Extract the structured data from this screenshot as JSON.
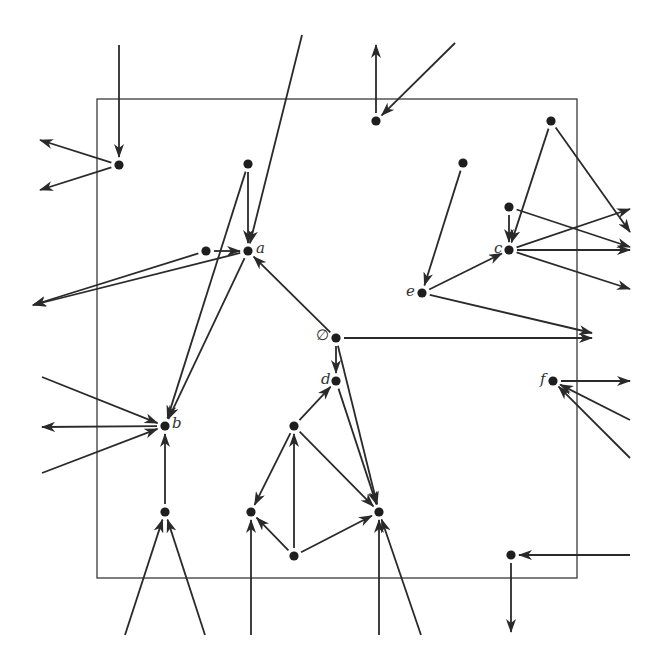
{
  "diagram": {
    "type": "directed-graph",
    "frame": {
      "x": 97,
      "y": 99,
      "width": 480,
      "height": 479
    },
    "colors": {
      "edge": "#2a2a2a",
      "node": "#1e1e1e",
      "frame": "#3a3a3a",
      "label": "#333333"
    },
    "labels": {
      "a": "a",
      "b": "b",
      "c": "c",
      "d": "d",
      "e": "e",
      "f": "f",
      "empty": "∅"
    },
    "nodes": [
      {
        "id": "n1",
        "x": 119,
        "y": 165,
        "label": ""
      },
      {
        "id": "n2",
        "x": 248,
        "y": 164,
        "label": ""
      },
      {
        "id": "a",
        "x": 248,
        "y": 251,
        "label": "a"
      },
      {
        "id": "n3",
        "x": 206,
        "y": 251,
        "label": ""
      },
      {
        "id": "b",
        "x": 165,
        "y": 426,
        "label": "b"
      },
      {
        "id": "empty",
        "x": 336,
        "y": 338,
        "label": "∅"
      },
      {
        "id": "d",
        "x": 336,
        "y": 381,
        "label": "d"
      },
      {
        "id": "n4",
        "x": 294,
        "y": 426,
        "label": ""
      },
      {
        "id": "n5",
        "x": 251,
        "y": 512,
        "label": ""
      },
      {
        "id": "n6",
        "x": 294,
        "y": 556,
        "label": ""
      },
      {
        "id": "n7",
        "x": 379,
        "y": 512,
        "label": ""
      },
      {
        "id": "n8",
        "x": 165,
        "y": 512,
        "label": ""
      },
      {
        "id": "n9",
        "x": 376,
        "y": 121,
        "label": ""
      },
      {
        "id": "n10",
        "x": 463,
        "y": 163,
        "label": ""
      },
      {
        "id": "n11",
        "x": 551,
        "y": 121,
        "label": ""
      },
      {
        "id": "n12",
        "x": 509,
        "y": 207,
        "label": ""
      },
      {
        "id": "c",
        "x": 509,
        "y": 250,
        "label": "c"
      },
      {
        "id": "e",
        "x": 422,
        "y": 293,
        "label": "e"
      },
      {
        "id": "f",
        "x": 553,
        "y": 381,
        "label": "f"
      },
      {
        "id": "n13",
        "x": 511,
        "y": 555,
        "label": ""
      }
    ],
    "edges": [
      {
        "from": [
          119,
          45
        ],
        "to": "n1"
      },
      {
        "from": "n1",
        "to": [
          40,
          140
        ]
      },
      {
        "from": "n1",
        "to": [
          40,
          190
        ]
      },
      {
        "from": "n2",
        "to": "a"
      },
      {
        "from": [
          302,
          35
        ],
        "to": "a"
      },
      {
        "from": "n3",
        "to": "a"
      },
      {
        "from": "n3",
        "to": [
          33,
          305
        ]
      },
      {
        "from": "a",
        "to": [
          33,
          305
        ]
      },
      {
        "from": "n2",
        "to": "b"
      },
      {
        "from": "a",
        "to": "b"
      },
      {
        "from": "empty",
        "to": "a"
      },
      {
        "from": [
          42,
          377
        ],
        "to": "b"
      },
      {
        "from": "b",
        "to": [
          42,
          427
        ]
      },
      {
        "from": [
          42,
          473
        ],
        "to": "b"
      },
      {
        "from": "n8",
        "to": "b"
      },
      {
        "from": [
          125,
          635
        ],
        "to": "n8"
      },
      {
        "from": [
          205,
          635
        ],
        "to": "n8"
      },
      {
        "from": "empty",
        "to": "d"
      },
      {
        "from": "empty",
        "to": "n7"
      },
      {
        "from": "d",
        "to": "n7"
      },
      {
        "from": "n4",
        "to": "d"
      },
      {
        "from": "n4",
        "to": "n5"
      },
      {
        "from": "n4",
        "to": "n7"
      },
      {
        "from": "n6",
        "to": "n4"
      },
      {
        "from": "n6",
        "to": "n5"
      },
      {
        "from": "n6",
        "to": "n7"
      },
      {
        "from": [
          251,
          635
        ],
        "to": "n5"
      },
      {
        "from": [
          379,
          635
        ],
        "to": "n7"
      },
      {
        "from": [
          421,
          635
        ],
        "to": "n7"
      },
      {
        "from": "empty",
        "to": [
          592,
          338
        ]
      },
      {
        "from": "n9",
        "to": [
          376,
          45
        ]
      },
      {
        "from": [
          455,
          43
        ],
        "to": "n9"
      },
      {
        "from": "n10",
        "to": "e"
      },
      {
        "from": "e",
        "to": "c"
      },
      {
        "from": "e",
        "to": [
          592,
          333
        ]
      },
      {
        "from": "n11",
        "to": "c"
      },
      {
        "from": "n11",
        "to": [
          630,
          232
        ]
      },
      {
        "from": "n12",
        "to": "c"
      },
      {
        "from": "n12",
        "to": [
          630,
          247
        ]
      },
      {
        "from": "c",
        "to": [
          630,
          209
        ]
      },
      {
        "from": "c",
        "to": [
          630,
          250
        ]
      },
      {
        "from": "c",
        "to": [
          630,
          289
        ]
      },
      {
        "from": "f",
        "to": [
          630,
          381
        ]
      },
      {
        "from": [
          630,
          420
        ],
        "to": "f"
      },
      {
        "from": [
          630,
          458
        ],
        "to": "f"
      },
      {
        "from": [
          630,
          555
        ],
        "to": "n13"
      },
      {
        "from": "n13",
        "to": [
          511,
          632
        ]
      }
    ]
  }
}
